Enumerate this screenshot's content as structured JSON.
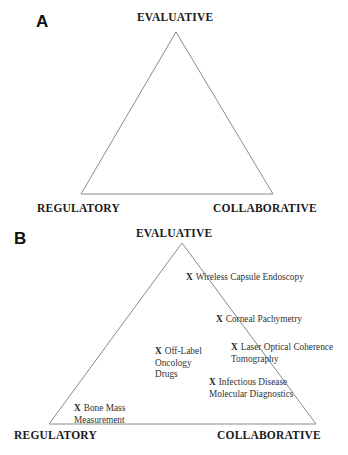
{
  "panel_a": {
    "label": "A",
    "vertices": {
      "top": "EVALUATIVE",
      "bottom_left": "REGULATORY",
      "bottom_right": "COLLABORATIVE"
    }
  },
  "panel_b": {
    "label": "B",
    "vertices": {
      "top": "EVALUATIVE",
      "bottom_left": "REGULATORY",
      "bottom_right": "COLLABORATIVE"
    },
    "marker": "X",
    "items": [
      {
        "lines": [
          "Wireless Capsule Endoscopy"
        ]
      },
      {
        "lines": [
          "Corneal Pachymetry"
        ]
      },
      {
        "lines": [
          "Laser Optical Coherence",
          "Tomography"
        ]
      },
      {
        "lines": [
          "Off-Label",
          "Oncology",
          "Drugs"
        ]
      },
      {
        "lines": [
          "Infectious Disease",
          "Molecular Diagnostics"
        ]
      },
      {
        "lines": [
          "Bone Mass",
          "Measurement"
        ]
      }
    ]
  },
  "colors": {
    "line": "#8a8a8a",
    "text": "#1a1a1a"
  }
}
